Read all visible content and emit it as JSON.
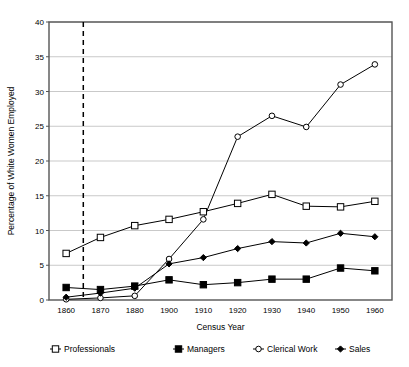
{
  "chart_data": {
    "type": "line",
    "title": "",
    "xlabel": "Census Year",
    "ylabel": "Percentage of White Women Employed",
    "categories": [
      "1860",
      "1870",
      "1880",
      "1900",
      "1910",
      "1920",
      "1930",
      "1940",
      "1950",
      "1960"
    ],
    "x_tick_labels": [
      "1860",
      "1870",
      "1880",
      "1900",
      "1910",
      "1920",
      "1930",
      "1940",
      "1950",
      "1960"
    ],
    "y_tick_labels": [
      "0",
      "5",
      "10",
      "15",
      "20",
      "25",
      "30",
      "35",
      "40"
    ],
    "y_ticks": [
      0,
      5,
      10,
      15,
      20,
      25,
      30,
      35,
      40
    ],
    "ylim": [
      0,
      40
    ],
    "grid": "horizontal",
    "legend_position": "bottom",
    "annotations": [
      {
        "name": "civil-war-reference-line",
        "type": "vline",
        "x_value": "1865",
        "style": "dashed",
        "color": "#000000"
      }
    ],
    "series": [
      {
        "name": "Professionals",
        "marker": "open-square",
        "color": "#000000",
        "values": [
          6.7,
          9.0,
          10.7,
          11.6,
          12.7,
          13.9,
          15.2,
          13.5,
          13.4,
          14.2
        ]
      },
      {
        "name": "Managers",
        "marker": "filled-square",
        "color": "#000000",
        "values": [
          1.8,
          1.5,
          2.0,
          2.9,
          2.2,
          2.5,
          3.0,
          3.0,
          4.6,
          4.2
        ]
      },
      {
        "name": "Clerical Work",
        "marker": "open-circle",
        "color": "#000000",
        "values": [
          0.1,
          0.3,
          0.6,
          5.9,
          11.6,
          23.5,
          26.5,
          24.9,
          31.0,
          33.9
        ]
      },
      {
        "name": "Sales",
        "marker": "filled-diamond",
        "color": "#000000",
        "values": [
          0.4,
          1.0,
          1.7,
          5.2,
          6.1,
          7.4,
          8.4,
          8.2,
          9.6,
          9.1
        ]
      }
    ]
  },
  "legend": {
    "items": [
      {
        "label": "Professionals",
        "marker": "open-square"
      },
      {
        "label": "Managers",
        "marker": "filled-square"
      },
      {
        "label": "Clerical Work",
        "marker": "open-circle"
      },
      {
        "label": "Sales",
        "marker": "filled-diamond"
      }
    ]
  },
  "colors": {
    "line": "#000000",
    "grid": "#c9c9c9",
    "frame": "#555555",
    "background": "#ffffff"
  }
}
